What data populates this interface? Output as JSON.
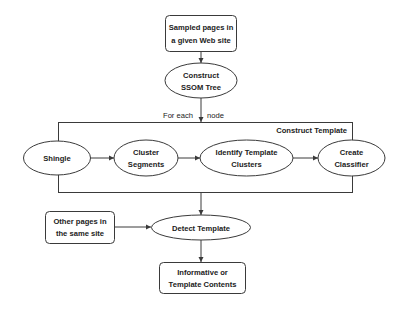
{
  "diagram": {
    "type": "flowchart",
    "nodes": {
      "sampled_pages": {
        "shape": "rounded-rect",
        "lines": [
          "Sampled pages in",
          "a given Web site"
        ]
      },
      "construct_ssom": {
        "shape": "ellipse",
        "lines": [
          "Construct",
          "SSOM Tree"
        ]
      },
      "shingle": {
        "shape": "ellipse",
        "lines": [
          "Shingle"
        ]
      },
      "cluster_segments": {
        "shape": "ellipse",
        "lines": [
          "Cluster",
          "Segments"
        ]
      },
      "identify_template_clusters": {
        "shape": "ellipse",
        "lines": [
          "Identify Template",
          "Clusters"
        ]
      },
      "create_classifier": {
        "shape": "ellipse",
        "lines": [
          "Create",
          "Classifier"
        ]
      },
      "other_pages": {
        "shape": "rounded-rect",
        "lines": [
          "Other pages in",
          "the same site"
        ]
      },
      "detect_template": {
        "shape": "ellipse",
        "lines": [
          "Detect Template"
        ]
      },
      "informative_contents": {
        "shape": "rounded-rect",
        "lines": [
          "Informative or",
          "Template Contents"
        ]
      }
    },
    "group": {
      "title": "Construct Template",
      "contains": [
        "shingle",
        "cluster_segments",
        "identify_template_clusters",
        "create_classifier"
      ]
    },
    "edge_labels": {
      "for_each": "For   each",
      "node": "node"
    },
    "edges": [
      {
        "from": "sampled_pages",
        "to": "construct_ssom"
      },
      {
        "from": "construct_ssom",
        "to": "construct_template_group",
        "label": "For each node"
      },
      {
        "from": "shingle",
        "to": "cluster_segments"
      },
      {
        "from": "cluster_segments",
        "to": "identify_template_clusters"
      },
      {
        "from": "identify_template_clusters",
        "to": "create_classifier"
      },
      {
        "from": "construct_template_group",
        "to": "detect_template"
      },
      {
        "from": "other_pages",
        "to": "detect_template"
      },
      {
        "from": "detect_template",
        "to": "informative_contents"
      }
    ],
    "colors": {
      "stroke": "#3a3a3a",
      "text": "#222222",
      "background": "#ffffff"
    }
  }
}
